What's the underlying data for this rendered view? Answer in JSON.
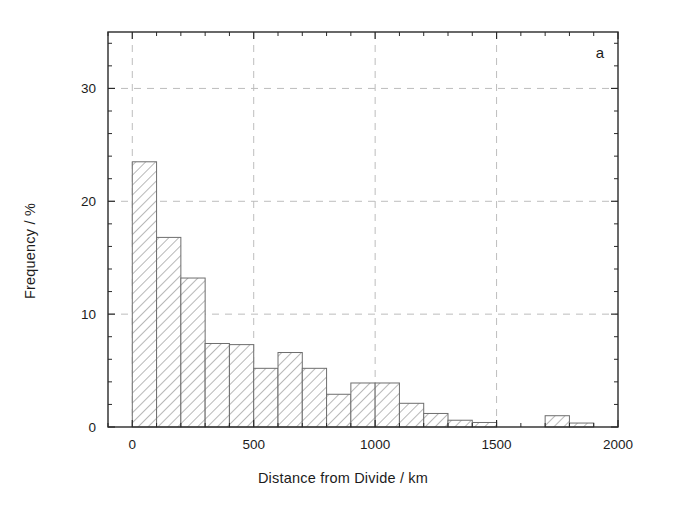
{
  "figure": {
    "panel_label": "a",
    "background": "#ffffff",
    "frame_color": "#2a2a2a",
    "grid_color": "#bdbdbd",
    "bar_edge_color": "#6e6e6e",
    "bar_hatch_color": "#9a9a9a"
  },
  "chart_data": {
    "type": "bar",
    "title": "",
    "subtitle": "",
    "xlabel": "Distance from Divide / km",
    "ylabel": "Frequency / %",
    "xlim": [
      -100,
      2000
    ],
    "ylim": [
      0,
      35
    ],
    "xticks": [
      0,
      500,
      1000,
      1500,
      2000
    ],
    "xticklabels": [
      "0",
      "500",
      "1000",
      "1500",
      "2000"
    ],
    "yticks": [
      0,
      10,
      20,
      30
    ],
    "yticklabels": [
      "0",
      "10",
      "20",
      "30"
    ],
    "minor_x_interval": 100,
    "minor_y_interval": 2,
    "grid": "dashed gridlines at major x (500,1000,1500) and major y (10,20,30)",
    "legend": "none",
    "bin_width": 100,
    "bin_edges": [
      0,
      100,
      200,
      300,
      400,
      500,
      600,
      700,
      800,
      900,
      1000,
      1100,
      1200,
      1300,
      1400,
      1500,
      1600,
      1700,
      1800,
      1900
    ],
    "categories": [
      "0-100",
      "100-200",
      "200-300",
      "300-400",
      "400-500",
      "500-600",
      "600-700",
      "700-800",
      "800-900",
      "900-1000",
      "1000-1100",
      "1100-1200",
      "1200-1300",
      "1300-1400",
      "1400-1500",
      "1500-1600",
      "1600-1700",
      "1700-1800",
      "1800-1900"
    ],
    "values": [
      23.5,
      16.8,
      13.2,
      7.4,
      7.3,
      5.2,
      6.6,
      5.2,
      2.9,
      3.9,
      3.9,
      2.1,
      1.2,
      0.6,
      0.4,
      0.0,
      0.0,
      1.0,
      0.35
    ],
    "annotations": [
      {
        "text": "a",
        "position": "top-right inside axes"
      }
    ]
  }
}
